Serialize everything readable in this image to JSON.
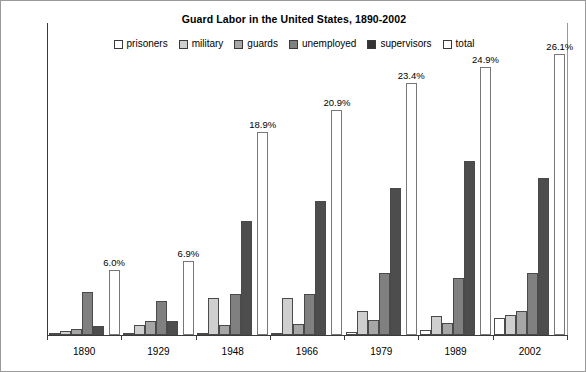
{
  "chart_data": {
    "type": "bar",
    "title": "Guard Labor in the United States, 1890-2002",
    "xlabel": "",
    "ylabel": "percent of the civilian labor force",
    "ylim": [
      0,
      29
    ],
    "grid": false,
    "legend_position": "top-center",
    "categories": [
      "1890",
      "1929",
      "1948",
      "1966",
      "1979",
      "1989",
      "2002"
    ],
    "series": [
      {
        "name": "prisoners",
        "color": "#ffffff",
        "values": [
          0.2,
          0.2,
          0.2,
          0.2,
          0.3,
          0.5,
          1.6
        ]
      },
      {
        "name": "military",
        "color": "#cfcfcf",
        "values": [
          0.4,
          0.9,
          3.4,
          3.4,
          2.2,
          1.8,
          1.9
        ]
      },
      {
        "name": "guards",
        "color": "#a6a6a6",
        "values": [
          0.6,
          1.3,
          0.9,
          1.0,
          1.4,
          1.1,
          2.2
        ]
      },
      {
        "name": "unemployed",
        "color": "#808080",
        "values": [
          4.0,
          3.2,
          3.8,
          3.8,
          5.8,
          5.3,
          5.8
        ]
      },
      {
        "name": "supervisors",
        "color": "#4d4d4d",
        "values": [
          0.8,
          1.3,
          10.6,
          12.5,
          13.7,
          16.2,
          14.6
        ]
      },
      {
        "name": "total",
        "color": "#ffffff",
        "values": [
          6.0,
          6.9,
          18.9,
          20.9,
          23.4,
          24.9,
          26.1
        ]
      }
    ],
    "total_labels": [
      "6.0%",
      "6.9%",
      "18.9%",
      "20.9%",
      "23.4%",
      "24.9%",
      "26.1%"
    ]
  },
  "legend": {
    "items": [
      {
        "label": "prisoners",
        "color": "#ffffff"
      },
      {
        "label": "military",
        "color": "#cfcfcf"
      },
      {
        "label": "guards",
        "color": "#a6a6a6"
      },
      {
        "label": "unemployed",
        "color": "#808080"
      },
      {
        "label": "supervisors",
        "color": "#333333"
      },
      {
        "label": "total",
        "color": "#ffffff"
      }
    ]
  }
}
